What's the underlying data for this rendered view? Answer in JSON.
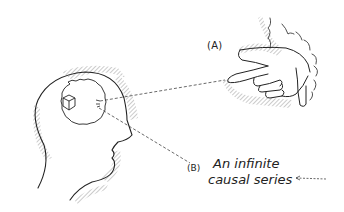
{
  "figure": {
    "label_a": "(A)",
    "label_b_marker": "(B)",
    "label_b_text_line1": "An infinite",
    "label_b_text_line2": "causal series",
    "elements": {
      "head": "head-in-profile",
      "thought": "cube-in-thought-cloud",
      "hand": "pointing-hand-from-cloud",
      "arrow_a": "dashed line from hand to head",
      "arrow_b": "dashed line from head to label B",
      "arrow_right": "dashed arrow pointing left toward label B"
    },
    "colors": {
      "ink": "#222222",
      "hatch": "#9a9a9a",
      "background": "#ffffff"
    }
  }
}
